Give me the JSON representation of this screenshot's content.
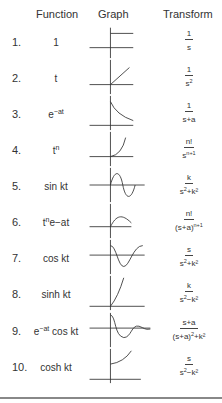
{
  "headers": {
    "function": "Function",
    "graph": "Graph",
    "transform": "Transform"
  },
  "rows": [
    {
      "num": "1.",
      "fn": "1",
      "fn_sup": "",
      "fn_tail": "",
      "tf_num": "1",
      "tf_den": "s",
      "tf_den_sup": "",
      "tf_den_tail": "",
      "graph": "step"
    },
    {
      "num": "2.",
      "fn": "t",
      "fn_sup": "",
      "fn_tail": "",
      "tf_num": "1",
      "tf_den": "s",
      "tf_den_sup": "2",
      "tf_den_tail": "",
      "graph": "ramp"
    },
    {
      "num": "3.",
      "fn": "e",
      "fn_sup": "−at",
      "fn_tail": "",
      "tf_num": "1",
      "tf_den": "s+a",
      "tf_den_sup": "",
      "tf_den_tail": "",
      "graph": "decay"
    },
    {
      "num": "4.",
      "fn": "t",
      "fn_sup": "n",
      "fn_tail": "",
      "tf_num": "n!",
      "tf_den": "s",
      "tf_den_sup": "n+1",
      "tf_den_tail": "",
      "graph": "power"
    },
    {
      "num": "5.",
      "fn": "sin kt",
      "fn_sup": "",
      "fn_tail": "",
      "tf_num": "k",
      "tf_den": "s",
      "tf_den_sup": "2",
      "tf_den_tail": "+k²",
      "graph": "sine"
    },
    {
      "num": "6.",
      "fn": "t",
      "fn_sup": "n",
      "fn_tail": "e−at",
      "tf_num": "n!",
      "tf_den": "(s+a)",
      "tf_den_sup": "n+1",
      "tf_den_tail": "",
      "graph": "hump"
    },
    {
      "num": "7.",
      "fn": "cos kt",
      "fn_sup": "",
      "fn_tail": "",
      "tf_num": "s",
      "tf_den": "s",
      "tf_den_sup": "2",
      "tf_den_tail": "+k²",
      "graph": "cosine"
    },
    {
      "num": "8.",
      "fn": "sinh kt",
      "fn_sup": "",
      "fn_tail": "",
      "tf_num": "k",
      "tf_den": "s",
      "tf_den_sup": "2",
      "tf_den_tail": "−k²",
      "graph": "sinh"
    },
    {
      "num": "9.",
      "fn": "e",
      "fn_sup": "−at",
      "fn_tail": " cos kt",
      "tf_num": "s+a",
      "tf_den": "(s+a)",
      "tf_den_sup": "2",
      "tf_den_tail": "+k²",
      "graph": "damped"
    },
    {
      "num": "10.",
      "fn": "cosh kt",
      "fn_sup": "",
      "fn_tail": "",
      "tf_num": "s",
      "tf_den": "s",
      "tf_den_sup": "2",
      "tf_den_tail": "−k²",
      "graph": "cosh"
    }
  ]
}
